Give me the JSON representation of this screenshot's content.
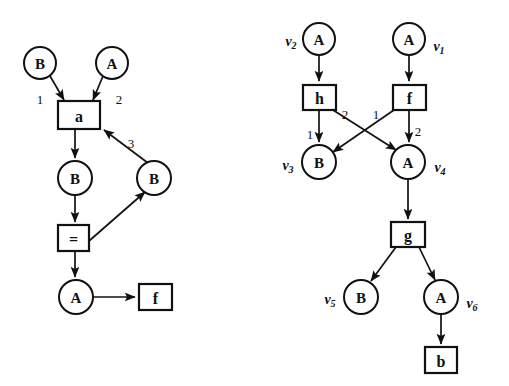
{
  "figure": {
    "background_color": "#ffffff",
    "ink_color": "#111111"
  },
  "left_graph": {
    "name": "left-term-graph",
    "nodes": [
      {
        "id": "l-b-top",
        "shape": "circle",
        "label": "B",
        "cx": 40,
        "cy": 63,
        "r": 16
      },
      {
        "id": "l-a-top",
        "shape": "circle",
        "label": "A",
        "cx": 112,
        "cy": 63,
        "r": 16
      },
      {
        "id": "l-box-a",
        "shape": "box",
        "label": "a",
        "x": 58,
        "y": 101,
        "w": 42,
        "h": 28
      },
      {
        "id": "l-b-mid",
        "shape": "circle",
        "label": "B",
        "cx": 75,
        "cy": 178,
        "r": 17
      },
      {
        "id": "l-b-right",
        "shape": "circle",
        "label": "B",
        "cx": 154,
        "cy": 178,
        "r": 17
      },
      {
        "id": "l-box-eq",
        "shape": "box",
        "label": "=",
        "x": 58,
        "y": 225,
        "w": 31,
        "h": 26
      },
      {
        "id": "l-a-bottom",
        "shape": "circle",
        "label": "A",
        "cx": 76,
        "cy": 297,
        "r": 17
      },
      {
        "id": "l-box-f",
        "shape": "box",
        "label": "f",
        "x": 139,
        "y": 284,
        "w": 33,
        "h": 26
      }
    ],
    "edges": [
      {
        "from": "l-b-top",
        "to": "l-box-a",
        "port": "1"
      },
      {
        "from": "l-a-top",
        "to": "l-box-a",
        "port": "2"
      },
      {
        "from": "l-box-a",
        "to": "l-b-mid",
        "port": ""
      },
      {
        "from": "l-b-mid",
        "to": "l-box-eq",
        "port": ""
      },
      {
        "from": "l-box-eq",
        "to": "l-a-bottom",
        "port": ""
      },
      {
        "from": "l-a-bottom",
        "to": "l-box-f",
        "port": ""
      },
      {
        "from": "l-box-eq",
        "to": "l-b-right",
        "port": ""
      },
      {
        "from": "l-b-right",
        "to": "l-box-a",
        "port": "3"
      }
    ],
    "port_labels": [
      {
        "text": "1",
        "x": 40,
        "y": 99
      },
      {
        "text": "2",
        "x": 119,
        "y": 99
      },
      {
        "text": "3",
        "x": 131,
        "y": 143
      }
    ]
  },
  "right_graph": {
    "name": "right-term-graph",
    "nodes": [
      {
        "id": "r-v2",
        "shape": "circle",
        "label": "A",
        "vertex": "v",
        "sub": "2",
        "cx": 319,
        "cy": 39,
        "r": 16
      },
      {
        "id": "r-v1",
        "shape": "circle",
        "label": "A",
        "vertex": "v",
        "sub": "1",
        "cx": 409,
        "cy": 39,
        "r": 16
      },
      {
        "id": "r-h",
        "shape": "box",
        "label": "h",
        "x": 303,
        "y": 85,
        "w": 33,
        "h": 25
      },
      {
        "id": "r-f",
        "shape": "box",
        "label": "f",
        "x": 393,
        "y": 85,
        "w": 33,
        "h": 25
      },
      {
        "id": "r-v3",
        "shape": "circle",
        "label": "B",
        "vertex": "v",
        "sub": "3",
        "cx": 319,
        "cy": 162,
        "r": 17
      },
      {
        "id": "r-v4",
        "shape": "circle",
        "label": "A",
        "vertex": "v",
        "sub": "4",
        "cx": 408,
        "cy": 162,
        "r": 17
      },
      {
        "id": "r-g",
        "shape": "box",
        "label": "g",
        "x": 391,
        "y": 222,
        "w": 34,
        "h": 25
      },
      {
        "id": "r-v5",
        "shape": "circle",
        "label": "B",
        "vertex": "v",
        "sub": "5",
        "cx": 361,
        "cy": 297,
        "r": 17
      },
      {
        "id": "r-v6",
        "shape": "circle",
        "label": "A",
        "vertex": "v",
        "sub": "6",
        "cx": 441,
        "cy": 297,
        "r": 17
      },
      {
        "id": "r-b",
        "shape": "box",
        "label": "b",
        "x": 425,
        "y": 347,
        "w": 32,
        "h": 26
      }
    ],
    "edges": [
      {
        "from": "r-v2",
        "to": "r-h",
        "port": ""
      },
      {
        "from": "r-v1",
        "to": "r-f",
        "port": ""
      },
      {
        "from": "r-h",
        "to": "r-v3",
        "port": "1"
      },
      {
        "from": "r-h",
        "to": "r-v4",
        "port": "2"
      },
      {
        "from": "r-f",
        "to": "r-v3",
        "port": "1"
      },
      {
        "from": "r-f",
        "to": "r-v4",
        "port": "2"
      },
      {
        "from": "r-v4",
        "to": "r-g",
        "port": ""
      },
      {
        "from": "r-g",
        "to": "r-v5",
        "port": ""
      },
      {
        "from": "r-g",
        "to": "r-v6",
        "port": ""
      },
      {
        "from": "r-v6",
        "to": "r-b",
        "port": ""
      }
    ],
    "port_labels": [
      {
        "text": "1",
        "x": 310,
        "y": 134
      },
      {
        "text": "2",
        "x": 345,
        "y": 114
      },
      {
        "text": "1",
        "x": 376,
        "y": 114
      },
      {
        "text": "2",
        "x": 418,
        "y": 131
      }
    ],
    "vertex_labels": [
      {
        "base": "v",
        "sub": "2",
        "x": 291,
        "y": 41
      },
      {
        "base": "v",
        "sub": "1",
        "x": 439,
        "y": 46
      },
      {
        "base": "v",
        "sub": "3",
        "x": 288,
        "y": 165
      },
      {
        "base": "v",
        "sub": "4",
        "x": 440,
        "y": 167
      },
      {
        "base": "v",
        "sub": "5",
        "x": 330,
        "y": 299
      },
      {
        "base": "v",
        "sub": "6",
        "x": 472,
        "y": 303
      }
    ]
  }
}
